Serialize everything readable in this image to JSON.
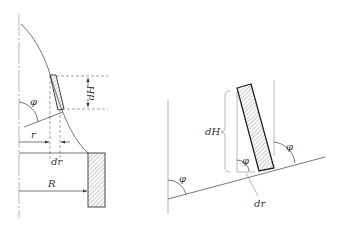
{
  "left_figure": {
    "labels": {
      "phi": "φ",
      "dH": "dH",
      "r": "r",
      "dr": "dr",
      "R": "R"
    }
  },
  "right_figure": {
    "labels": {
      "dH": "dH",
      "phi_left": "φ",
      "phi_element": "φ",
      "phi_right": "φ",
      "dr": "dr"
    }
  },
  "colors": {
    "line": "#555555",
    "hatch": "#666666",
    "background": "#ffffff"
  }
}
